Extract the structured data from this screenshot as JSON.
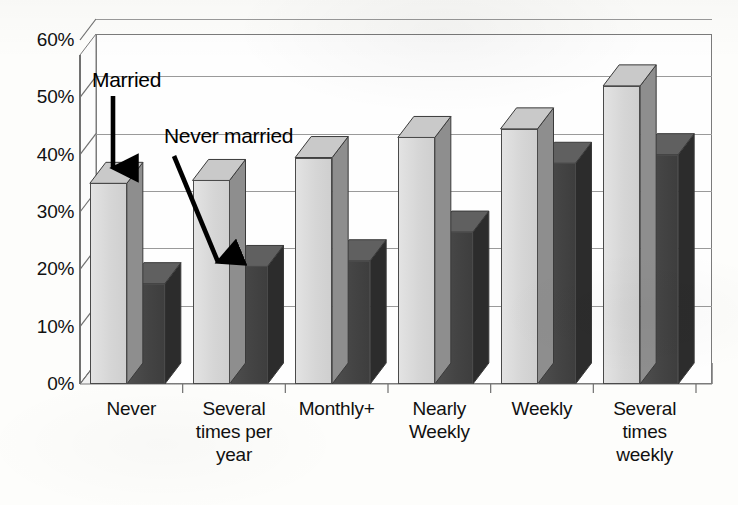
{
  "chart_data": {
    "type": "bar",
    "title": "",
    "xlabel": "",
    "ylabel": "",
    "ylim": [
      0,
      60
    ],
    "ytick_labels": [
      "0%",
      "10%",
      "20%",
      "30%",
      "40%",
      "50%",
      "60%"
    ],
    "ytick_values": [
      0,
      10,
      20,
      30,
      40,
      50,
      60
    ],
    "grid": true,
    "legend_position": "none (inline arrow annotations)",
    "style": "3D clustered column, grayscale scan",
    "categories": [
      "Never",
      "Several times per year",
      "Monthly+",
      "Nearly Weekly",
      "Weekly",
      "Several times weekly"
    ],
    "category_lines": [
      [
        "Never"
      ],
      [
        "Several",
        "times per",
        "year"
      ],
      [
        "Monthly+"
      ],
      [
        "Nearly",
        "Weekly"
      ],
      [
        "Weekly"
      ],
      [
        "Several",
        "times",
        "weekly"
      ]
    ],
    "series": [
      {
        "name": "Married",
        "color": "#d8d8d8",
        "values": [
          35,
          35.5,
          39.5,
          43,
          44.5,
          52
        ]
      },
      {
        "name": "Never married",
        "color": "#464646",
        "values": [
          17.5,
          20.5,
          21.5,
          26.5,
          38.5,
          40
        ]
      }
    ]
  },
  "annotations": [
    {
      "id": "married",
      "label": "Married",
      "arrow": "down"
    },
    {
      "id": "never-married",
      "label": "Never married",
      "arrow": "down-right"
    }
  ],
  "colors": {
    "background": "#fdfdfb",
    "axis": "#6f6f6f",
    "gridline": "#9a9a9a",
    "married_bar": "#d8d8d8",
    "never_married_bar": "#464646",
    "text": "#111111"
  }
}
